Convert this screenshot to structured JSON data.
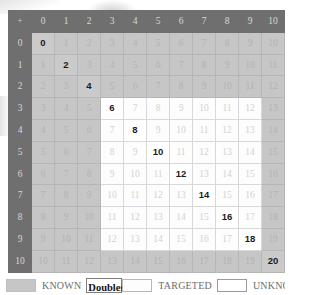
{
  "grid": {
    "corner_symbol": "+",
    "column_headers": [
      "0",
      "1",
      "2",
      "3",
      "4",
      "5",
      "6",
      "7",
      "8",
      "9",
      "10"
    ],
    "row_headers": [
      "0",
      "1",
      "2",
      "3",
      "4",
      "5",
      "6",
      "7",
      "8",
      "9",
      "10"
    ],
    "size": 11,
    "description": "Addition table where each cell equals row index plus column index",
    "targeted_region": {
      "row_start": 3,
      "row_end": 9,
      "col_start": 3,
      "col_end": 9
    },
    "rows": [
      [
        "0",
        "1",
        "2",
        "3",
        "4",
        "5",
        "6",
        "7",
        "8",
        "9",
        "10"
      ],
      [
        "1",
        "2",
        "3",
        "4",
        "5",
        "6",
        "7",
        "8",
        "9",
        "10",
        "11"
      ],
      [
        "2",
        "3",
        "4",
        "5",
        "6",
        "7",
        "8",
        "9",
        "10",
        "11",
        "12"
      ],
      [
        "3",
        "4",
        "5",
        "6",
        "7",
        "8",
        "9",
        "10",
        "11",
        "12",
        "13"
      ],
      [
        "4",
        "5",
        "6",
        "7",
        "8",
        "9",
        "10",
        "11",
        "12",
        "13",
        "14"
      ],
      [
        "5",
        "6",
        "7",
        "8",
        "9",
        "10",
        "11",
        "12",
        "13",
        "14",
        "15"
      ],
      [
        "6",
        "7",
        "8",
        "9",
        "10",
        "11",
        "12",
        "13",
        "14",
        "15",
        "16"
      ],
      [
        "7",
        "8",
        "9",
        "10",
        "11",
        "12",
        "13",
        "14",
        "15",
        "16",
        "17"
      ],
      [
        "8",
        "9",
        "10",
        "11",
        "12",
        "13",
        "14",
        "15",
        "16",
        "17",
        "18"
      ],
      [
        "9",
        "10",
        "11",
        "12",
        "13",
        "14",
        "15",
        "16",
        "17",
        "18",
        "19"
      ],
      [
        "10",
        "11",
        "12",
        "13",
        "14",
        "15",
        "16",
        "17",
        "18",
        "19",
        "20"
      ]
    ],
    "doubles": [
      "0",
      "2",
      "4",
      "6",
      "8",
      "10",
      "12",
      "14",
      "16",
      "18",
      "20"
    ]
  },
  "legend": {
    "items": [
      {
        "label": "KNOWN",
        "swatch": "known-sw",
        "name": "legend-swatch-known"
      },
      {
        "label": "Doubles",
        "swatch": "double-sw",
        "name": "legend-swatch-doubles"
      },
      {
        "label": "TARGETED",
        "swatch": "targeted-sw",
        "name": "legend-swatch-targeted"
      },
      {
        "label": "UNKNOWN",
        "swatch": "unknown-sw",
        "name": "legend-swatch-unknown"
      }
    ]
  },
  "colors": {
    "header": "#6f6f6f",
    "known": "#c6c6c6",
    "targeted": "#fdfdfd",
    "unknown": "#ffffff",
    "double_text": "#1b1b1b",
    "cell_text": "#b2b2b2"
  }
}
